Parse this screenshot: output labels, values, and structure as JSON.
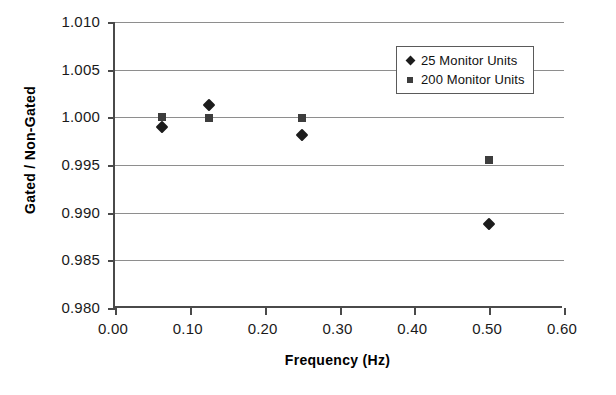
{
  "chart_data": {
    "type": "scatter",
    "title": "",
    "xlabel": "Frequency (Hz)",
    "ylabel": "Gated / Non-Gated",
    "xlim": [
      0.0,
      0.6
    ],
    "ylim": [
      0.98,
      1.01
    ],
    "xticks": [
      "0.00",
      "0.10",
      "0.20",
      "0.30",
      "0.40",
      "0.50",
      "0.60"
    ],
    "xtick_values": [
      0.0,
      0.1,
      0.2,
      0.3,
      0.4,
      0.5,
      0.6
    ],
    "yticks": [
      "0.980",
      "0.985",
      "0.990",
      "0.995",
      "1.000",
      "1.005",
      "1.010"
    ],
    "ytick_values": [
      0.98,
      0.985,
      0.99,
      0.995,
      1.0,
      1.005,
      1.01
    ],
    "grid": "horizontal",
    "legend_position": "top-right",
    "series": [
      {
        "name": "25 Monitor Units",
        "marker": "diamond",
        "color": "#1c1c1c",
        "x": [
          0.0625,
          0.125,
          0.25,
          0.5
        ],
        "y": [
          0.999,
          1.0013,
          0.9981,
          0.9888
        ]
      },
      {
        "name": "200 Monitor Units",
        "marker": "square",
        "color": "#3d3d3d",
        "x": [
          0.0625,
          0.125,
          0.25,
          0.5
        ],
        "y": [
          1.0,
          0.9999,
          0.9999,
          0.9955
        ]
      }
    ]
  },
  "legend": {
    "items": [
      {
        "label": "25 Monitor Units",
        "marker": "diamond"
      },
      {
        "label": "200 Monitor Units",
        "marker": "square"
      }
    ]
  }
}
